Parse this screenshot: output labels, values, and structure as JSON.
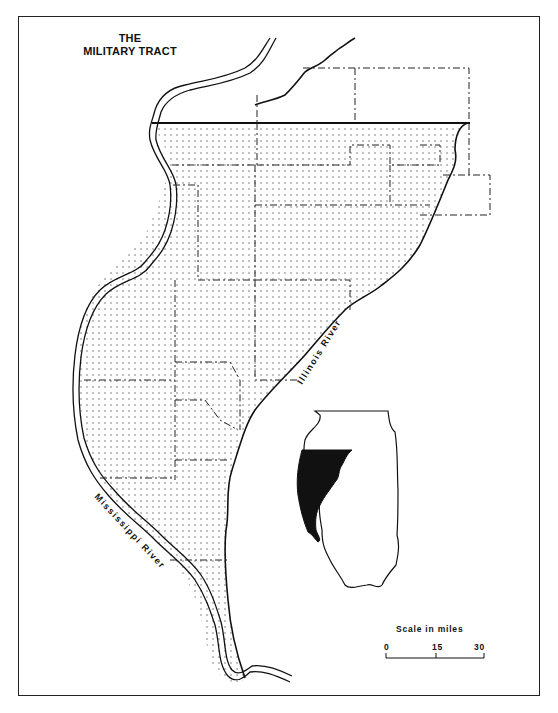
{
  "map": {
    "title_line1": "THE",
    "title_line2": "MILITARY TRACT",
    "labels": {
      "illinois_river": "Illinois River",
      "mississippi_river": "Mississippi River"
    },
    "inset": {
      "description": "Illinois state outline with Military Tract shaded"
    },
    "scale": {
      "title": "Scale in miles",
      "ticks": [
        "0",
        "15",
        "30"
      ]
    },
    "colors": {
      "ink": "#111111",
      "background": "#ffffff",
      "stipple": "#555555"
    }
  }
}
